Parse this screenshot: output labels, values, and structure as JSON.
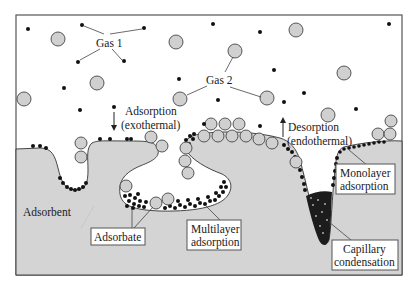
{
  "figure": {
    "frame": {
      "x": 16,
      "y": 15,
      "width": 386,
      "height": 260,
      "border_color": "#555555"
    },
    "colors": {
      "adsorbent_fill": "#d4d4d4",
      "gas1_molecule": "#111111",
      "gas2_molecule_fill": "#d0d0d0",
      "gas2_molecule_stroke": "#444444",
      "background": "#ffffff"
    }
  },
  "labels": {
    "gas1": "Gas 1",
    "gas2": "Gas 2",
    "adsorption_line1": "Adsorption",
    "adsorption_line2": "(exothermal)",
    "desorption_line1": "Desorption",
    "desorption_line2": "(endothermal)",
    "adsorbent": "Adsorbent",
    "adsorbate": "Adsorbate",
    "multilayer_line1": "Multilayer",
    "multilayer_line2": "adsorption",
    "monolayer_line1": "Monolayer",
    "monolayer_line2": "adsorption",
    "capillary_line1": "Capillary",
    "capillary_line2": "condensation"
  },
  "legend_semantics": {
    "gas1_icon": "small-black-dot",
    "gas2_icon": "large-gray-circle",
    "adsorption_arrow": "arrow-down-icon",
    "desorption_arrow": "arrow-up-icon"
  }
}
